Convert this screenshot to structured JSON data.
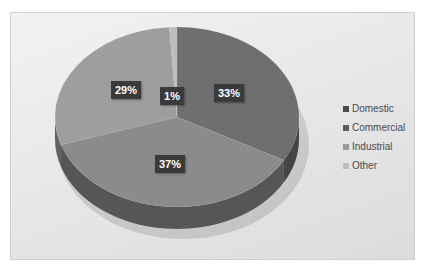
{
  "chart_data": {
    "type": "pie",
    "style": "3d",
    "title": "",
    "categories": [
      "Domestic",
      "Commercial",
      "Industrial",
      "Other"
    ],
    "values": [
      33,
      37,
      29,
      1
    ],
    "labels": [
      "33%",
      "37%",
      "29%",
      "1%"
    ],
    "colors": [
      "#6f6f6f",
      "#8b8b8b",
      "#9e9e9e",
      "#bdbdbd"
    ],
    "legend_position": "right"
  },
  "legend": {
    "items": [
      {
        "label": "Domestic",
        "color": "#4a4a4a"
      },
      {
        "label": "Commercial",
        "color": "#5a5a5a"
      },
      {
        "label": "Industrial",
        "color": "#9a9a9a"
      },
      {
        "label": "Other",
        "color": "#bdbdbd"
      }
    ]
  },
  "data_labels": {
    "domestic": "33%",
    "commercial": "37%",
    "industrial": "29%",
    "other": "1%"
  }
}
